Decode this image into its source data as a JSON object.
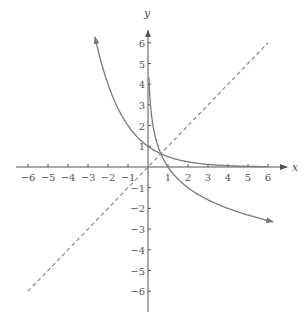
{
  "chart_data": {
    "type": "line",
    "title": "",
    "xlabel": "x",
    "ylabel": "y",
    "xlim": [
      -6,
      6
    ],
    "ylim": [
      -6,
      6
    ],
    "grid": false,
    "x_ticks": [
      -6,
      -5,
      -4,
      -3,
      -2,
      -1,
      1,
      2,
      3,
      4,
      5,
      6
    ],
    "x_tick_labels": [
      "−6",
      "−5",
      "−4",
      "−3",
      "−2",
      "−1",
      "1",
      "2",
      "3",
      "4",
      "5",
      "6"
    ],
    "y_ticks": [
      6,
      5,
      4,
      3,
      2,
      1,
      -1,
      -2,
      -3,
      -4,
      -5,
      -6
    ],
    "y_tick_labels": [
      "6",
      "5",
      "4",
      "3",
      "2",
      "1",
      "−1",
      "−2",
      "−3",
      "−4",
      "−5",
      "−6"
    ],
    "series": [
      {
        "name": "y = (1/2)^x",
        "style": "solid",
        "function": "exp_half",
        "x_range": [
          -2.65,
          6
        ],
        "arrow_start": true,
        "arrow_end": false,
        "points": [
          [
            -2.6,
            6.06
          ],
          [
            -2,
            4
          ],
          [
            -1,
            2
          ],
          [
            0,
            1
          ],
          [
            1,
            0.5
          ],
          [
            2,
            0.25
          ],
          [
            3,
            0.125
          ],
          [
            4,
            0.0625
          ],
          [
            5,
            0.031
          ],
          [
            6,
            0.016
          ]
        ]
      },
      {
        "name": "y = log_(1/2) x",
        "style": "solid",
        "function": "log_half",
        "x_range": [
          0.05,
          6.25
        ],
        "arrow_start": false,
        "arrow_end": true,
        "points": [
          [
            0.06,
            4.06
          ],
          [
            0.25,
            2
          ],
          [
            0.5,
            1
          ],
          [
            1,
            0
          ],
          [
            2,
            -1
          ],
          [
            3,
            -1.58
          ],
          [
            4,
            -2
          ],
          [
            5,
            -2.32
          ],
          [
            6,
            -2.58
          ]
        ]
      },
      {
        "name": "y = x",
        "style": "dashed",
        "function": "identity",
        "x_range": [
          -6,
          6
        ],
        "arrow_start": false,
        "arrow_end": false,
        "points": [
          [
            -6,
            -6
          ],
          [
            6,
            6
          ]
        ]
      }
    ],
    "colors": {
      "curve": "#7a7a7a",
      "axis": "#555555",
      "dashed": "#8a8a8a"
    }
  }
}
